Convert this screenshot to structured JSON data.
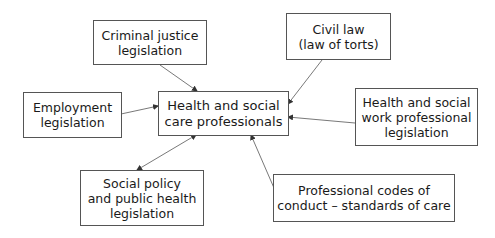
{
  "diagram": {
    "type": "hub-and-spoke",
    "center": {
      "id": "health_social_care_professionals",
      "label": "Health and social\ncare professionals"
    },
    "nodes": [
      {
        "id": "criminal_justice",
        "label": "Criminal justice\nlegislation"
      },
      {
        "id": "civil_law",
        "label": "Civil law\n(law of torts)"
      },
      {
        "id": "employment",
        "label": "Employment\nlegislation"
      },
      {
        "id": "hsw_professional",
        "label": "Health and social\nwork professional\nlegislation"
      },
      {
        "id": "social_policy",
        "label": "Social policy\nand public health\nlegislation"
      },
      {
        "id": "professional_codes",
        "label": "Professional codes of\nconduct – standards of care"
      }
    ],
    "edges": [
      {
        "from": "criminal_justice",
        "to": "health_social_care_professionals",
        "direction": "to-center"
      },
      {
        "from": "civil_law",
        "to": "health_social_care_professionals",
        "direction": "to-center"
      },
      {
        "from": "employment",
        "to": "health_social_care_professionals",
        "direction": "to-center"
      },
      {
        "from": "hsw_professional",
        "to": "health_social_care_professionals",
        "direction": "to-center"
      },
      {
        "from": "social_policy",
        "to": "health_social_care_professionals",
        "direction": "bidirectional"
      },
      {
        "from": "professional_codes",
        "to": "health_social_care_professionals",
        "direction": "to-center"
      }
    ],
    "colors": {
      "border": "#555555",
      "text": "#1a1a1a",
      "arrow": "#444444",
      "background": "#ffffff"
    }
  }
}
